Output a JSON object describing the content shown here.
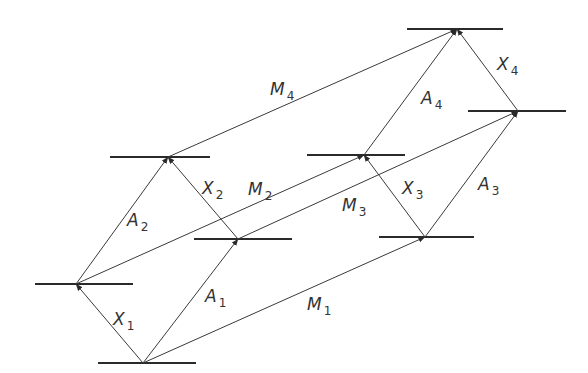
{
  "diagram": {
    "type": "energy-level transition lattice",
    "colors": {
      "line": "#2a2a2a",
      "arrow": "#3a3a3a",
      "text": "#333333",
      "background": "#ffffff"
    },
    "levels": [
      {
        "id": "L0",
        "x1": 98,
        "x2": 196,
        "y": 363,
        "node_x": 143
      },
      {
        "id": "L1",
        "x1": 35,
        "x2": 133,
        "y": 284,
        "node_x": 76
      },
      {
        "id": "L2",
        "x1": 194,
        "x2": 292,
        "y": 239,
        "node_x": 238
      },
      {
        "id": "L3",
        "x1": 110,
        "x2": 210,
        "y": 157,
        "node_x": 168
      },
      {
        "id": "L4",
        "x1": 379,
        "x2": 474,
        "y": 237,
        "node_x": 425
      },
      {
        "id": "L5",
        "x1": 307,
        "x2": 405,
        "y": 155,
        "node_x": 364
      },
      {
        "id": "L6",
        "x1": 468,
        "x2": 566,
        "y": 111,
        "node_x": 518
      },
      {
        "id": "L7",
        "x1": 407,
        "x2": 503,
        "y": 29,
        "node_x": 457
      }
    ],
    "transitions": [
      {
        "name": "X",
        "sub": "1",
        "from": [
          143,
          363
        ],
        "to": [
          76,
          284
        ],
        "label_x": 113,
        "label_y": 325
      },
      {
        "name": "A",
        "sub": "1",
        "from": [
          143,
          363
        ],
        "to": [
          238,
          239
        ],
        "label_x": 205,
        "label_y": 302
      },
      {
        "name": "M",
        "sub": "1",
        "from": [
          143,
          363
        ],
        "to": [
          425,
          237
        ],
        "label_x": 307,
        "label_y": 310
      },
      {
        "name": "A",
        "sub": "2",
        "from": [
          76,
          284
        ],
        "to": [
          168,
          157
        ],
        "label_x": 127,
        "label_y": 226
      },
      {
        "name": "M",
        "sub": "2",
        "from": [
          76,
          284
        ],
        "to": [
          364,
          155
        ],
        "label_x": 248,
        "label_y": 195
      },
      {
        "name": "X",
        "sub": "2",
        "from": [
          238,
          239
        ],
        "to": [
          168,
          157
        ],
        "label_x": 202,
        "label_y": 194
      },
      {
        "name": "M",
        "sub": "3",
        "from": [
          238,
          239
        ],
        "to": [
          518,
          111
        ],
        "label_x": 342,
        "label_y": 211
      },
      {
        "name": "M",
        "sub": "4",
        "from": [
          168,
          157
        ],
        "to": [
          457,
          29
        ],
        "label_x": 270,
        "label_y": 95
      },
      {
        "name": "X",
        "sub": "3",
        "from": [
          425,
          237
        ],
        "to": [
          364,
          155
        ],
        "label_x": 402,
        "label_y": 194
      },
      {
        "name": "A",
        "sub": "3",
        "from": [
          425,
          237
        ],
        "to": [
          518,
          111
        ],
        "label_x": 478,
        "label_y": 190
      },
      {
        "name": "A",
        "sub": "4",
        "from": [
          364,
          155
        ],
        "to": [
          457,
          29
        ],
        "label_x": 421,
        "label_y": 104
      },
      {
        "name": "X",
        "sub": "4",
        "from": [
          518,
          111
        ],
        "to": [
          457,
          29
        ],
        "label_x": 497,
        "label_y": 70
      }
    ]
  }
}
